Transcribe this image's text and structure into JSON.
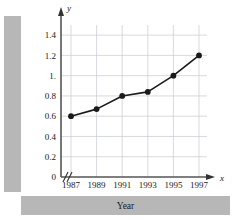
{
  "chart_data": {
    "type": "line",
    "title": "",
    "xlabel": "Year",
    "ylabel": "Cost (millions of dollars)",
    "x_axis_name": "x",
    "y_axis_name": "y",
    "categories": [
      "1987",
      "1989",
      "1991",
      "1993",
      "1995",
      "1997"
    ],
    "x": [
      1987,
      1989,
      1991,
      1993,
      1995,
      1997
    ],
    "values": [
      0.6,
      0.67,
      0.8,
      0.84,
      1.0,
      1.2
    ],
    "xtick_labels": [
      "1987",
      "1989",
      "1991",
      "1993",
      "1995",
      "1997"
    ],
    "ytick_labels": [
      "0",
      "0.2",
      "0.4",
      "0.6",
      "0.8",
      "1.",
      "1.2",
      "1.4"
    ],
    "ytick_values": [
      0,
      0.2,
      0.4,
      0.6,
      0.8,
      1.0,
      1.2,
      1.4
    ],
    "ylim": [
      0,
      1.5
    ],
    "grid": true,
    "legend": "none",
    "axis_break": "//",
    "marker": "filled-circle",
    "line_color": "#1a1a1a",
    "marker_color": "#1a1a1a",
    "grid_color": "#c8c8d2",
    "band_color": "#b7b7b7"
  }
}
